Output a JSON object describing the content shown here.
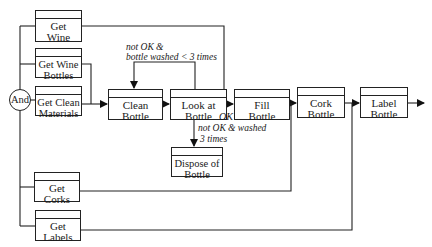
{
  "diagram": {
    "type": "process-flow",
    "junction": {
      "label": "And"
    },
    "inputs": {
      "get_wine": "Get Wine",
      "get_wine_bottles": "Get Wine Bottles",
      "get_clean_materials": "Get Clean Materials",
      "get_corks": "Get Corks",
      "get_labels": "Get Labels"
    },
    "steps": {
      "clean_bottle": "Clean Bottle",
      "look_at_bottle": "Look at Bottle",
      "fill_bottle": "Fill Bottle",
      "cork_bottle": "Cork Bottle",
      "label_bottle": "Label Bottle",
      "dispose_of_bottle": "Dispose of Bottle"
    },
    "conditions": {
      "loop_back_line1": "not OK &",
      "loop_back_line2": "bottle washed < 3 times",
      "ok": "OK",
      "dispose_line1": "not OK & washed",
      "dispose_line2": "3 times"
    },
    "colors": {
      "line": "#222222",
      "background": "#ffffff"
    }
  }
}
